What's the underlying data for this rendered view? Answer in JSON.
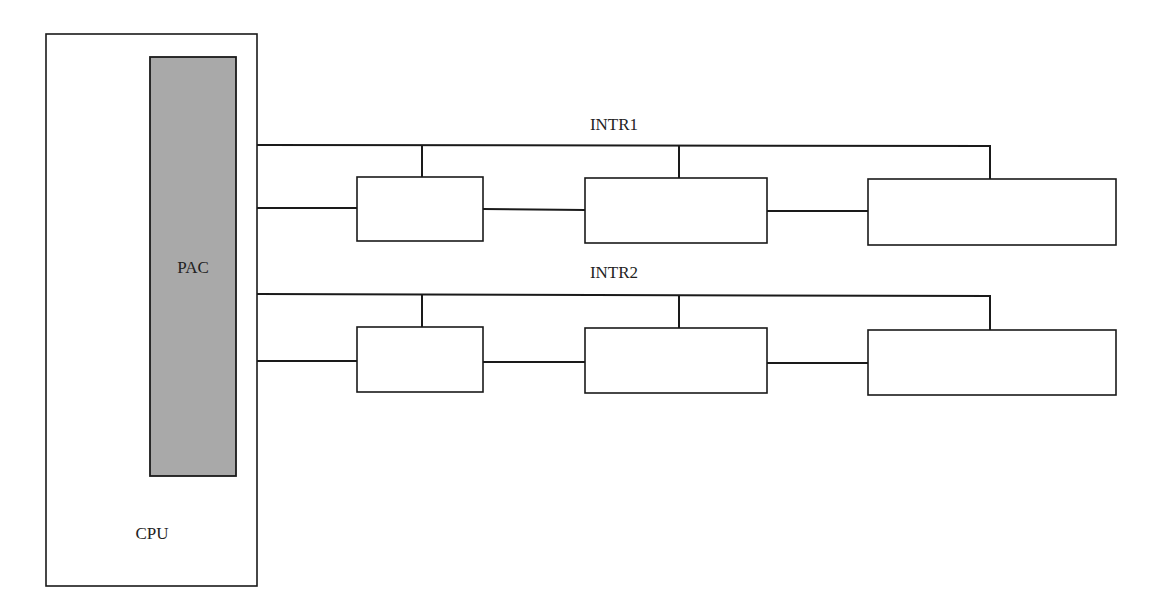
{
  "diagram": {
    "cpu": {
      "label": "CPU"
    },
    "pac": {
      "label": "PAC",
      "fill": "#a9a9a9"
    },
    "buses": [
      {
        "label": "INTR1",
        "devices": 3
      },
      {
        "label": "INTR2",
        "devices": 3
      }
    ]
  }
}
